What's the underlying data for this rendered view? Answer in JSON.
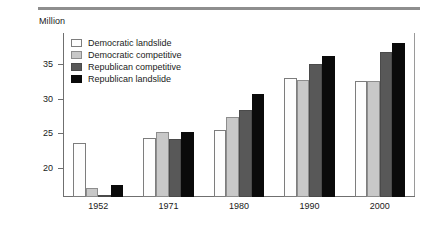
{
  "figure": {
    "unit_label": "Million"
  },
  "chart_data": {
    "type": "bar",
    "title": "",
    "subtitle": "",
    "xlabel": "",
    "ylabel": "Million",
    "categories": [
      "1952",
      "1971",
      "1980",
      "1990",
      "2000"
    ],
    "series": [
      {
        "name": "Democratic landslide",
        "color": "#fdfdfd",
        "values": [
          23.6,
          24.3,
          25.5,
          33.0,
          32.6
        ]
      },
      {
        "name": "Democratic competitive",
        "color": "#c8c8c8",
        "values": [
          17.0,
          25.1,
          27.4,
          32.7,
          32.5
        ]
      },
      {
        "name": "Republican competitive",
        "color": "#585858",
        "values": [
          15.9,
          24.1,
          28.3,
          35.0,
          36.8
        ]
      },
      {
        "name": "Republican landslide",
        "color": "#0a0a0a",
        "values": [
          17.5,
          25.1,
          30.7,
          36.1,
          38.1
        ]
      }
    ],
    "yticks": [
      20,
      25,
      30,
      35
    ],
    "ytick_labels": [
      "20",
      "25",
      "30",
      "35"
    ],
    "ylim": [
      15.74,
      39.5
    ],
    "grid": false,
    "legend_position": "top-left-inside"
  }
}
